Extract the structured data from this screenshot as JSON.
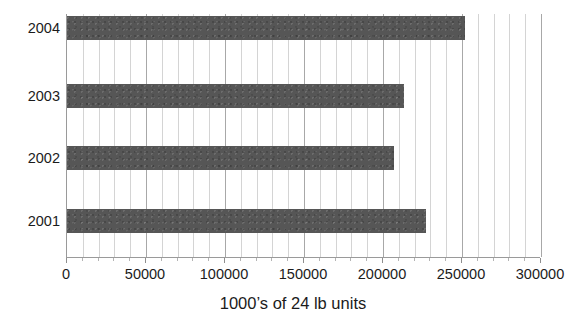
{
  "chart_data": {
    "type": "bar",
    "orientation": "horizontal",
    "title": "",
    "xlabel": "1000’s of 24 lb units",
    "ylabel": "",
    "categories": [
      "2001",
      "2002",
      "2003",
      "2004"
    ],
    "values": [
      227000,
      207000,
      213000,
      252000
    ],
    "series": [
      {
        "name": "",
        "values": [
          227000,
          207000,
          213000,
          252000
        ]
      }
    ],
    "xlim": [
      0,
      300000
    ],
    "xticks": [
      0,
      50000,
      100000,
      150000,
      200000,
      250000,
      300000
    ],
    "xtick_labels": [
      "0",
      "50000",
      "100000",
      "150000",
      "200000",
      "250000",
      "300000"
    ],
    "minor_tick_step": 10000,
    "grid": {
      "vertical": true,
      "horizontal": false,
      "minor_vertical": true
    },
    "legend": {
      "visible": false,
      "position": "none"
    },
    "colors": {
      "bar": "#565656",
      "gridline_minor": "#d4d4d4",
      "gridline_major": "#a8a8a8",
      "axis_line": "#9a9a9a",
      "text": "#1b1b1b",
      "background": "#ffffff"
    },
    "bars": [
      {
        "category": "2004",
        "value": 252000,
        "top": 2,
        "label": "2004"
      },
      {
        "category": "2003",
        "value": 213000,
        "top": 70,
        "label": "2003"
      },
      {
        "category": "2002",
        "value": 207000,
        "top": 132,
        "label": "2002"
      },
      {
        "category": "2001",
        "value": 227000,
        "top": 195,
        "label": "2001"
      }
    ]
  }
}
